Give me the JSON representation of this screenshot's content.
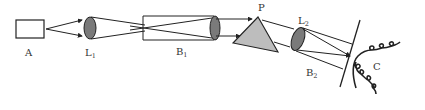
{
  "diagram": {
    "colors": {
      "line": "#222222",
      "lens_fill": "#7a7a7a",
      "prism_fill": "#bdbdbd",
      "background": "#ffffff"
    },
    "labels": {
      "source": "A",
      "lens1_main": "L",
      "lens1_sub": "1",
      "beam1_main": "B",
      "beam1_sub": "1",
      "prism": "P",
      "lens2_main": "L",
      "lens2_sub": "2",
      "beam2_main": "B",
      "beam2_sub": "2",
      "coil": "C"
    }
  }
}
